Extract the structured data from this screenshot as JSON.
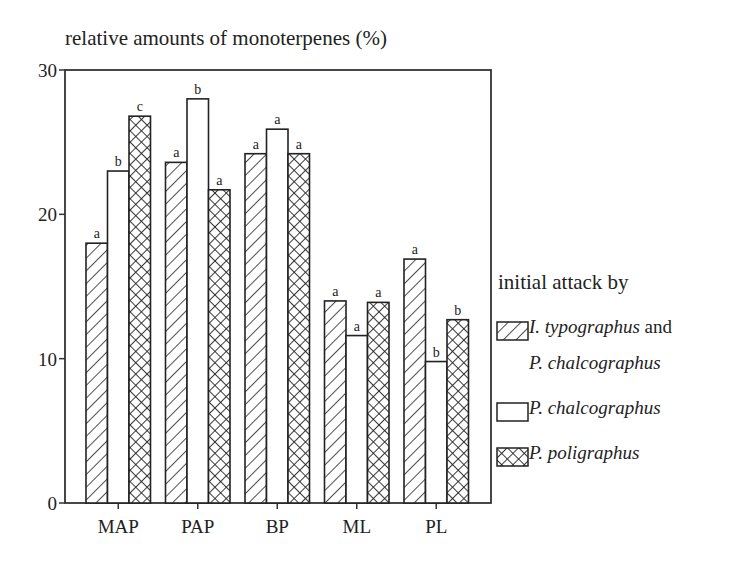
{
  "chart_data": {
    "type": "bar",
    "title": "relative amounts of monoterpenes (%)",
    "xlabel": "",
    "ylabel": "relative amounts of monoterpenes (%)",
    "ylim": [
      0,
      30
    ],
    "yticks": [
      0,
      10,
      20,
      30
    ],
    "grid": false,
    "legend_position": "right",
    "legend_title": "initial attack by",
    "categories": [
      "MAP",
      "PAP",
      "BP",
      "ML",
      "PL"
    ],
    "series": [
      {
        "name": "I. typographus and P. chalcographus",
        "pattern": "diagonal-hatch",
        "values": [
          18.0,
          23.6,
          24.2,
          14.0,
          16.9
        ],
        "labels": [
          "a",
          "a",
          "a",
          "a",
          "a"
        ]
      },
      {
        "name": "P. chalcographus",
        "pattern": "none",
        "values": [
          23.0,
          28.0,
          25.9,
          11.6,
          9.8
        ],
        "labels": [
          "b",
          "b",
          "a",
          "a",
          "b"
        ]
      },
      {
        "name": "P. poligraphus",
        "pattern": "cross-hatch",
        "values": [
          26.8,
          21.7,
          24.2,
          13.9,
          12.7
        ],
        "labels": [
          "c",
          "a",
          "a",
          "a",
          "b"
        ]
      }
    ]
  },
  "legend": {
    "title": "initial attack by",
    "items": [
      {
        "line1_italic": "I. typographus",
        "line1_rest": " and",
        "line2_italic": "P. chalcographus"
      },
      {
        "line1_italic": "P. chalcographus"
      },
      {
        "line1_italic": "P. poligraphus"
      }
    ]
  }
}
